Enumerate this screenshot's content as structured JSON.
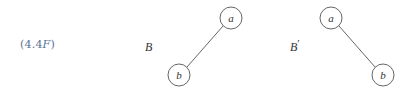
{
  "equation_label": {
    "prefix": "(4.4",
    "italic": "F",
    "suffix": ")",
    "color": "#5a7296"
  },
  "trees": [
    {
      "name": "B",
      "prime": "",
      "nodes": [
        {
          "id": "a",
          "label": "a",
          "cx": 231,
          "cy": 18
        },
        {
          "id": "b",
          "label": "b",
          "cx": 179,
          "cy": 75
        }
      ],
      "edges": [
        {
          "from": "a",
          "to": "b"
        }
      ]
    },
    {
      "name": "B",
      "prime": "′",
      "nodes": [
        {
          "id": "a",
          "label": "a",
          "cx": 331,
          "cy": 18
        },
        {
          "id": "b",
          "label": "b",
          "cx": 383,
          "cy": 75
        }
      ],
      "edges": [
        {
          "from": "a",
          "to": "b"
        }
      ]
    }
  ],
  "style": {
    "node_radius": 11,
    "stroke": "#555555",
    "text": "#333333"
  }
}
